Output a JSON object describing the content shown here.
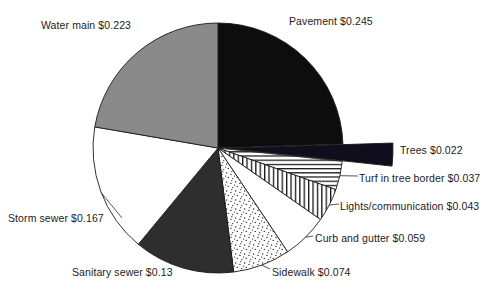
{
  "chart_data": {
    "type": "pie",
    "title": "",
    "subtitle": "",
    "xlabel": "",
    "ylabel": "",
    "units": "dollars per unit",
    "total": 1.0,
    "legend_position": "none",
    "labels_position": "outside-callout",
    "grid": false,
    "start_angle_deg": 0,
    "direction": "clockwise",
    "categories": [
      "Pavement",
      "Trees",
      "Turf in tree border",
      "Lights/communication",
      "Curb and gutter",
      "Sidewalk",
      "Sanitary sewer",
      "Storm sewer",
      "Water main"
    ],
    "values": [
      0.245,
      0.022,
      0.037,
      0.043,
      0.059,
      0.074,
      0.13,
      0.167,
      0.223
    ],
    "value_labels": [
      "$0.245",
      "$0.022",
      "$0.037",
      "$0.043",
      "$0.059",
      "$0.074",
      "$0.13",
      "$0.167",
      "$0.223"
    ],
    "slices": [
      {
        "name": "pavement",
        "label": "Pavement $0.245",
        "category": "Pavement",
        "value": 0.245,
        "value_label": "$0.245",
        "percent": 24.5,
        "start_deg": 0,
        "sweep_deg": 88.2,
        "fill": "#0d0d0d",
        "pattern": "solid-black",
        "exploded": false
      },
      {
        "name": "trees",
        "label": "Trees $0.022",
        "category": "Trees",
        "value": 0.022,
        "value_label": "$0.022",
        "percent": 2.2,
        "start_deg": 88.2,
        "sweep_deg": 7.92,
        "fill": "#100d1c",
        "pattern": "solid-black",
        "exploded": true
      },
      {
        "name": "turf-in-tree-border",
        "label": "Turf in tree border $0.037",
        "category": "Turf in tree border",
        "value": 0.037,
        "value_label": "$0.037",
        "percent": 3.7,
        "start_deg": 96.12,
        "sweep_deg": 13.32,
        "fill": "#ffffff",
        "pattern": "horizontal-lines",
        "exploded": false
      },
      {
        "name": "lights-communication",
        "label": "Lights/communication $0.043",
        "category": "Lights/communication",
        "value": 0.043,
        "value_label": "$0.043",
        "percent": 4.3,
        "start_deg": 109.44,
        "sweep_deg": 15.48,
        "fill": "#ffffff",
        "pattern": "vertical-lines",
        "exploded": false
      },
      {
        "name": "curb-and-gutter",
        "label": "Curb and gutter $0.059",
        "category": "Curb and gutter",
        "value": 0.059,
        "value_label": "$0.059",
        "percent": 5.9,
        "start_deg": 124.92,
        "sweep_deg": 21.24,
        "fill": "#ffffff",
        "pattern": "solid-white",
        "exploded": false
      },
      {
        "name": "sidewalk",
        "label": "Sidewalk $0.074",
        "category": "Sidewalk",
        "value": 0.074,
        "value_label": "$0.074",
        "percent": 7.4,
        "start_deg": 146.16,
        "sweep_deg": 26.64,
        "fill": "#ffffff",
        "pattern": "stipple-dots",
        "exploded": false
      },
      {
        "name": "sanitary-sewer",
        "label": "Sanitary sewer $0.13",
        "category": "Sanitary sewer",
        "value": 0.13,
        "value_label": "$0.13",
        "percent": 13.0,
        "start_deg": 172.8,
        "sweep_deg": 46.8,
        "fill": "#2e2e2e",
        "pattern": "solid-dark-gray",
        "exploded": false
      },
      {
        "name": "storm-sewer",
        "label": "Storm sewer $0.167",
        "category": "Storm sewer",
        "value": 0.167,
        "value_label": "$0.167",
        "percent": 16.7,
        "start_deg": 219.6,
        "sweep_deg": 60.12,
        "fill": "#ffffff",
        "pattern": "solid-white",
        "exploded": false
      },
      {
        "name": "water-main",
        "label": "Water main $0.223",
        "category": "Water main",
        "value": 0.223,
        "value_label": "$0.223",
        "percent": 22.3,
        "start_deg": 279.72,
        "sweep_deg": 80.28,
        "fill": "#8a8a8a",
        "pattern": "solid-medium-gray",
        "exploded": false
      }
    ],
    "colors": {
      "solid_black": "#0d0d0d",
      "dark_gray": "#2e2e2e",
      "medium_gray": "#8a8a8a",
      "white": "#ffffff",
      "outline": "#1a1a1a",
      "background": "#ffffff"
    },
    "geometry": {
      "center_x": 218,
      "center_y": 148,
      "radius": 125,
      "explode_offset_px": 8
    }
  }
}
